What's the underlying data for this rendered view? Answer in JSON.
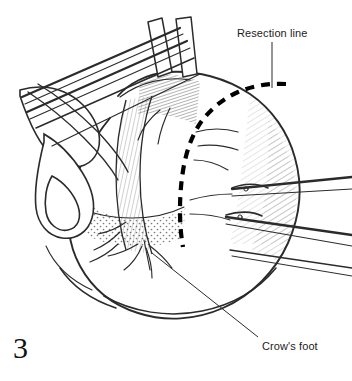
{
  "figure": {
    "number": "3",
    "domain": "surgical-anatomical-illustration",
    "background_color": "#ffffff",
    "ink_color": "#1c1c1c",
    "line_color": "#333333"
  },
  "annotations": [
    {
      "id": "resection-line",
      "label": "Resection line",
      "text_x": 237,
      "text_y": 27,
      "leader": {
        "x1": 272,
        "y1": 42,
        "x2": 272,
        "y2": 88
      }
    },
    {
      "id": "crows-foot",
      "label": "Crow's foot",
      "text_x": 262,
      "text_y": 340,
      "leader": {
        "x1": 258,
        "y1": 337,
        "x2": 152,
        "y2": 253
      }
    }
  ],
  "resection_path": {
    "stroke_color": "#000000",
    "stroke_width": 4.2,
    "dash_pattern": "9 7",
    "description": "Thick dashed line curving from upper right across the cardia and down along the lesser curvature",
    "d": "M 286 84 C 268 83 252 86 238 92 C 222 99 210 110 201 122 C 192 135 187 150 184 165 C 181 181 180 196 180 210 C 180 224 181 236 183 247"
  },
  "outlines": {
    "stomach_body": "M 118 96 C 128 84 146 74 168 72 C 196 70 226 78 250 94 C 272 109 288 132 295 158 C 303 186 300 216 288 243 C 275 272 252 295 223 308 C 196 320 165 322 138 313 C 112 305 92 288 80 266 C 68 244 66 218 72 193 C 78 166 92 140 110 118 Z",
    "greater_curve_fold": "M 76 206 C 92 214 112 218 132 218 C 152 218 170 214 184 207",
    "fundus_upper": "M 120 97 C 140 82 166 76 190 80",
    "antrum_lower": "M 104 296 C 132 312 168 318 202 311 C 232 305 258 290 276 268",
    "duodenum_curve": "M 60 268 C 72 286 92 300 116 308",
    "esophagus_left": "M 28 92 C 46 104 66 120 84 138 C 98 152 110 166 118 180",
    "liver_edge": "M 20 90 C 34 86 50 86 64 92 C 78 98 88 108 94 120",
    "left_lobe_flap": "M 32 128 C 46 138 62 152 74 168 C 84 181 90 194 92 206 C 94 220 90 232 80 240 C 70 247 58 246 50 238 C 42 230 40 216 44 202",
    "left_pouch": "M 48 160 C 62 166 74 178 80 192 C 86 206 84 220 74 228 C 64 235 52 232 46 222 C 40 212 40 198 46 186",
    "left_small": "M 56 186 C 66 190 74 200 76 210 C 78 220 74 228 66 230 C 58 232 50 226 48 216"
  },
  "lesser_curvature_band": {
    "left_edge": "M 126 100 C 120 122 116 148 116 174 C 116 200 119 226 126 250",
    "right_edge": "M 152 96 C 144 120 140 148 140 176 C 140 204 144 230 152 254",
    "description": "Hatched gastrohepatic ligament band along lesser curvature"
  },
  "instruments": [
    {
      "name": "retractor-shaft-1",
      "type": "line",
      "points": [
        22,
        96,
        180,
        28
      ],
      "width": 2.2
    },
    {
      "name": "retractor-shaft-2",
      "type": "line",
      "points": [
        26,
        108,
        186,
        36
      ],
      "width": 2.2
    },
    {
      "name": "retractor-shaft-3",
      "type": "line",
      "points": [
        34,
        120,
        192,
        48
      ],
      "width": 1.6
    },
    {
      "name": "retractor-blade-left",
      "type": "rect-path",
      "d": "M 148 22 L 160 18 L 170 72 L 156 76 Z"
    },
    {
      "name": "retractor-blade-right",
      "type": "rect-path",
      "d": "M 176 20 L 190 18 L 196 74 L 182 76 Z"
    },
    {
      "name": "forceps-upper-right",
      "type": "line",
      "points": [
        232,
        190,
        348,
        178
      ],
      "width": 2.4
    },
    {
      "name": "forceps-upper-right-b",
      "type": "line",
      "points": [
        232,
        196,
        348,
        190
      ],
      "width": 1.4
    },
    {
      "name": "forceps-lower-right",
      "type": "line",
      "points": [
        226,
        218,
        348,
        236
      ],
      "width": 2.4
    },
    {
      "name": "forceps-lower-right-b",
      "type": "line",
      "points": [
        226,
        224,
        348,
        246
      ],
      "width": 1.4
    },
    {
      "name": "clamp-jaw-upper",
      "type": "path",
      "d": "M 232 188 C 244 184 258 184 268 188"
    },
    {
      "name": "clamp-jaw-lower",
      "type": "path",
      "d": "M 226 216 C 238 212 252 212 262 216"
    }
  ],
  "vessels": [
    {
      "name": "crows-foot-branch-1",
      "d": "M 150 246 C 158 252 166 260 172 268"
    },
    {
      "name": "crows-foot-branch-2",
      "d": "M 146 248 C 150 258 152 268 152 278"
    },
    {
      "name": "crows-foot-branch-3",
      "d": "M 142 246 C 138 256 132 264 124 270"
    },
    {
      "name": "crows-foot-branch-4",
      "d": "M 138 244 C 128 250 118 254 108 256"
    },
    {
      "name": "gastric-branch-right-1",
      "d": "M 190 200 C 204 196 218 194 232 194"
    },
    {
      "name": "gastric-branch-right-2",
      "d": "M 190 214 C 204 214 218 216 230 220"
    },
    {
      "name": "gastric-branch-upper",
      "d": "M 196 132 C 210 128 224 128 238 132"
    },
    {
      "name": "gastric-branch-upper-2",
      "d": "M 198 146 C 212 144 226 146 238 150"
    },
    {
      "name": "short-gastric-1",
      "d": "M 120 232 C 112 240 104 246 94 250"
    },
    {
      "name": "short-gastric-2",
      "d": "M 118 244 C 110 252 100 258 90 262"
    }
  ],
  "texture_regions": [
    {
      "name": "fundus-shading",
      "type": "hatch",
      "note": "fine curved hatch upper right of body"
    },
    {
      "name": "right-contour-shading",
      "type": "hatch",
      "note": "dense hatch along right gastric border"
    },
    {
      "name": "omentum-stipple",
      "type": "stipple",
      "note": "stippled dots along greater curvature"
    },
    {
      "name": "cardia-dark-hatch",
      "type": "dense-hatch",
      "note": "dark hatching at gastroesophageal junction"
    }
  ]
}
